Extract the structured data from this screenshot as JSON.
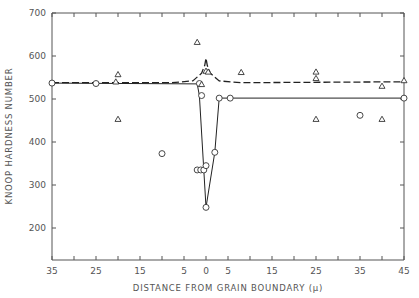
{
  "chart_data": {
    "type": "scatter",
    "title": "",
    "xlabel": "DISTANCE FROM GRAIN BOUNDARY (μ)",
    "ylabel": "KNOOP HARDNESS NUMBER",
    "xlim": [
      -35,
      45
    ],
    "ylim": [
      125,
      700
    ],
    "grid": false,
    "legend": "none",
    "x_ticks": [
      -35,
      -30,
      -25,
      -20,
      -15,
      -10,
      -5,
      0,
      5,
      10,
      15,
      20,
      25,
      30,
      35,
      40,
      45
    ],
    "x_tick_labels": [
      {
        "x": -35,
        "label": "35"
      },
      {
        "x": -25,
        "label": "25"
      },
      {
        "x": -15,
        "label": "15"
      },
      {
        "x": -5,
        "label": "5"
      },
      {
        "x": 0,
        "label": "0"
      },
      {
        "x": 5,
        "label": "5"
      },
      {
        "x": 15,
        "label": "15"
      },
      {
        "x": 25,
        "label": "25"
      },
      {
        "x": 35,
        "label": "35"
      },
      {
        "x": 45,
        "label": "45"
      }
    ],
    "y_ticks": [
      200,
      300,
      400,
      500,
      600,
      700
    ],
    "y_tick_labels": [
      "200",
      "300",
      "400",
      "500",
      "600",
      "700"
    ],
    "series": [
      {
        "name": "circles",
        "marker": "circle",
        "points": [
          [
            -35,
            537
          ],
          [
            -25,
            536
          ],
          [
            -1.5,
            536
          ],
          [
            -1,
            508
          ],
          [
            -10,
            373
          ],
          [
            -2,
            335
          ],
          [
            -1.2,
            335
          ],
          [
            -0.5,
            335
          ],
          [
            0,
            345
          ],
          [
            0,
            248
          ],
          [
            2,
            376
          ],
          [
            3,
            502
          ],
          [
            5.5,
            502
          ],
          [
            35,
            462
          ],
          [
            45,
            502
          ]
        ]
      },
      {
        "name": "triangles",
        "marker": "triangle",
        "points": [
          [
            -20,
            557
          ],
          [
            -20.5,
            540
          ],
          [
            -20,
            453
          ],
          [
            -2,
            632
          ],
          [
            0,
            565
          ],
          [
            0.5,
            563
          ],
          [
            -1,
            534
          ],
          [
            8,
            562
          ],
          [
            25,
            563
          ],
          [
            25,
            548
          ],
          [
            25,
            453
          ],
          [
            40,
            530
          ],
          [
            40,
            453
          ],
          [
            45,
            543
          ]
        ]
      },
      {
        "name": "solid-fit",
        "style": "solid",
        "points": [
          [
            -35,
            537
          ],
          [
            -2,
            535
          ],
          [
            -1.5,
            508
          ],
          [
            0,
            248
          ],
          [
            2,
            376
          ],
          [
            3,
            502
          ],
          [
            45,
            502
          ]
        ]
      },
      {
        "name": "dashed-fit",
        "style": "dashed",
        "points": [
          [
            -35,
            538
          ],
          [
            -8,
            538
          ],
          [
            -3,
            542
          ],
          [
            -1,
            560
          ],
          [
            -0.3,
            578
          ],
          [
            0,
            595
          ],
          [
            0.3,
            578
          ],
          [
            1,
            560
          ],
          [
            3,
            542
          ],
          [
            8,
            538
          ],
          [
            45,
            540
          ]
        ]
      }
    ]
  }
}
